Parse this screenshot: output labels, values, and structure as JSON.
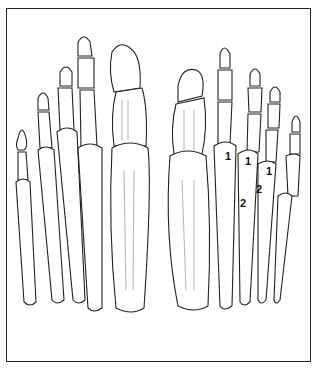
{
  "figure": {
    "type": "anatomical line drawing",
    "labels": [
      {
        "text": "1",
        "x": 225,
        "y": 150
      },
      {
        "text": "1",
        "x": 245,
        "y": 155
      },
      {
        "text": "1",
        "x": 266,
        "y": 165
      },
      {
        "text": "2",
        "x": 256,
        "y": 183
      },
      {
        "text": "2",
        "x": 240,
        "y": 197
      }
    ],
    "colors": {
      "line": "#222222",
      "background": "#ffffff"
    }
  }
}
